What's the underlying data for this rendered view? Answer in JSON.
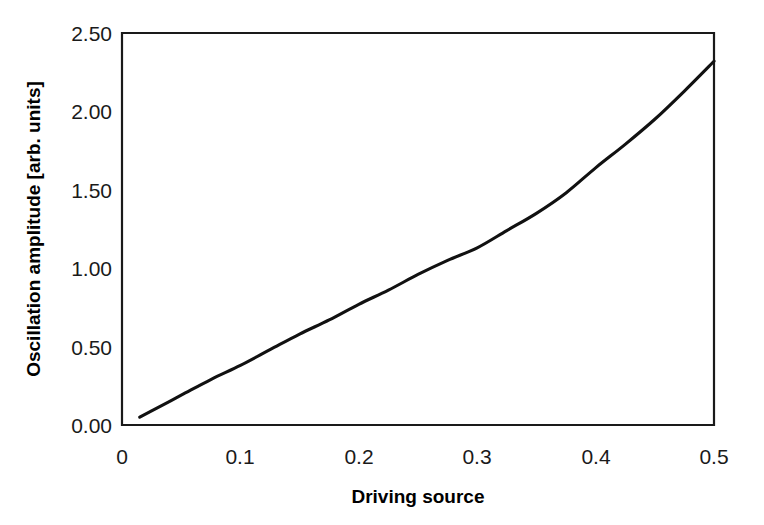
{
  "chart_data": {
    "type": "line",
    "title": "",
    "subtitle": "",
    "xlabel": "Driving source",
    "ylabel": "Oscillation amplitude [arb. units]",
    "xlim": [
      0,
      0.5
    ],
    "ylim": [
      0,
      2.5
    ],
    "xticks": [
      0,
      0.1,
      0.2,
      0.3,
      0.4,
      0.5
    ],
    "xtick_labels": [
      "0",
      "0.1",
      "0.2",
      "0.3",
      "0.4",
      "0.5"
    ],
    "yticks": [
      0,
      0.5,
      1.0,
      1.5,
      2.0,
      2.5
    ],
    "ytick_labels": [
      "0.00",
      "0.50",
      "1.00",
      "1.50",
      "2.00",
      "2.50"
    ],
    "grid": false,
    "legend": null,
    "legend_position": "none",
    "series": [
      {
        "name": "Oscillation amplitude",
        "color": "#111111",
        "x": [
          0.015,
          0.025,
          0.05,
          0.075,
          0.1,
          0.125,
          0.15,
          0.175,
          0.2,
          0.225,
          0.25,
          0.275,
          0.3,
          0.325,
          0.35,
          0.375,
          0.4,
          0.425,
          0.45,
          0.475,
          0.5
        ],
        "values": [
          0.05,
          0.09,
          0.19,
          0.29,
          0.38,
          0.48,
          0.58,
          0.67,
          0.77,
          0.86,
          0.96,
          1.05,
          1.13,
          1.24,
          1.35,
          1.48,
          1.64,
          1.79,
          1.95,
          2.13,
          2.32
        ]
      }
    ],
    "axis_color": "#1a1a1a",
    "background_color": "#ffffff"
  },
  "figure": {
    "accessible_name": "Line plot of oscillation amplitude versus driving source"
  }
}
